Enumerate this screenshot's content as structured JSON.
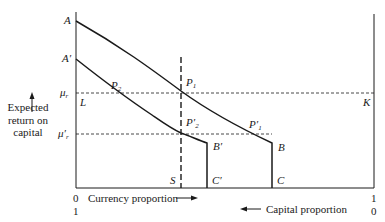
{
  "diagram": {
    "y_axis_label": [
      "Expected",
      "return on",
      "capital"
    ],
    "x_axis_label_bottom_left": "Currency proportion",
    "x_axis_label_bottom_right": "Capital proportion",
    "ticks": {
      "left_top": "0",
      "left_bottom": "1",
      "right_top": "1",
      "right_bottom": "0"
    },
    "points": {
      "A": "A",
      "A_prime": "A′",
      "P1": "P",
      "P1_sub": "1",
      "P2": "P",
      "P2_sub": "2",
      "P2_prime": "P′",
      "P2_prime_sub": "2",
      "P1_prime": "P′",
      "P1_prime_sub": "1",
      "B": "B",
      "B_prime": "B′",
      "C": "C",
      "C_prime": "C′",
      "S": "S",
      "L": "L",
      "K": "K"
    },
    "levels": {
      "mu_r": "μ",
      "mu_r_sub": "r",
      "mu_r_prime": "μ′",
      "mu_r_prime_sub": "r"
    },
    "colors": {
      "line": "#1a1a1a",
      "background": "#ffffff"
    }
  }
}
